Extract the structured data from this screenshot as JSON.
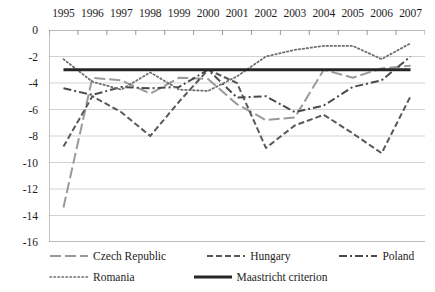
{
  "chart_data": {
    "type": "line",
    "title": "",
    "xlabel": "",
    "ylabel": "",
    "categories": [
      "1995",
      "1996",
      "1997",
      "1998",
      "1999",
      "2000",
      "2001",
      "2002",
      "2003",
      "2004",
      "2005",
      "2006",
      "2007"
    ],
    "ylim": [
      -16,
      0
    ],
    "yticks": [
      "0",
      "-2",
      "-4",
      "-6",
      "-8",
      "-10",
      "-12",
      "-14",
      "-16"
    ],
    "ytick_values": [
      0,
      -2,
      -4,
      -6,
      -8,
      -10,
      -12,
      -14,
      -16
    ],
    "grid": true,
    "xaxis_position": "top",
    "legend_position": "bottom",
    "series": [
      {
        "name": "Czech Republic",
        "style": "long-dash",
        "color": "#9a9a9a",
        "values": [
          -13.4,
          -3.6,
          -3.8,
          -4.8,
          -3.6,
          -3.7,
          -5.6,
          -6.8,
          -6.6,
          -3.0,
          -3.6,
          -2.9,
          -2.7
        ]
      },
      {
        "name": "Hungary",
        "style": "dashed",
        "color": "#595959",
        "values": [
          -8.8,
          -5.0,
          -6.2,
          -8.0,
          -5.4,
          -3.0,
          -4.0,
          -8.9,
          -7.2,
          -6.4,
          -7.8,
          -9.3,
          -5.0
        ]
      },
      {
        "name": "Poland",
        "style": "dash-dot",
        "color": "#4a4a4a",
        "values": [
          -4.4,
          -4.9,
          -4.3,
          -4.4,
          -4.3,
          -3.0,
          -5.1,
          -5.0,
          -6.2,
          -5.7,
          -4.3,
          -3.8,
          -2.0
        ]
      },
      {
        "name": "Romania",
        "style": "dotted",
        "color": "#6e6e6e",
        "values": [
          -2.2,
          -3.9,
          -4.5,
          -3.2,
          -4.5,
          -4.6,
          -3.5,
          -2.0,
          -1.5,
          -1.2,
          -1.2,
          -2.2,
          -1.0
        ]
      },
      {
        "name": "Maastricht criterion",
        "style": "solid",
        "color": "#262626",
        "values": [
          -3.0,
          -3.0,
          -3.0,
          -3.0,
          -3.0,
          -3.0,
          -3.0,
          -3.0,
          -3.0,
          -3.0,
          -3.0,
          -3.0,
          -3.0
        ]
      }
    ]
  },
  "legend": {
    "row1": [
      "Czech Republic",
      "Hungary",
      "Poland"
    ],
    "row2": [
      "Romania",
      "Maastricht criterion"
    ]
  }
}
